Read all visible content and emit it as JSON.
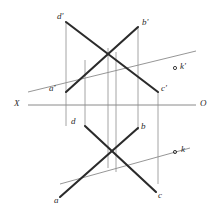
{
  "figure": {
    "type": "descriptive-geometry-projection-diagram",
    "background_color": "#ffffff",
    "ink_color": "#2b2b2b",
    "thin_line_color": "#8a8a8a",
    "connector_line_color": "#9a9a9a",
    "axis_label_left": "X",
    "axis_label_right": "O",
    "axis": {
      "name": "x-axis-ground-line",
      "x1": 28,
      "y1": 105,
      "x2": 196,
      "y2": 105
    },
    "points": {
      "a_prime": {
        "label": "a'",
        "x": 66,
        "y": 92,
        "label_x": 49,
        "label_y": 84
      },
      "b_prime": {
        "label": "b'",
        "x": 138,
        "y": 27,
        "label_x": 142,
        "label_y": 18
      },
      "c_prime": {
        "label": "c'",
        "x": 158,
        "y": 92,
        "label_x": 161,
        "label_y": 84
      },
      "d_prime": {
        "label": "d'",
        "x": 66,
        "y": 22,
        "label_x": 57,
        "label_y": 12
      },
      "a": {
        "label": "a",
        "x": 60,
        "y": 197,
        "label_x": 54,
        "label_y": 196
      },
      "b": {
        "label": "b",
        "x": 138,
        "y": 128,
        "label_x": 141,
        "label_y": 122
      },
      "c": {
        "label": "c",
        "x": 156,
        "y": 192,
        "label_x": 158,
        "label_y": 191
      },
      "d": {
        "label": "d",
        "x": 85,
        "y": 126,
        "label_x": 71,
        "label_y": 117
      },
      "k_prime": {
        "label": "k'",
        "x": 175,
        "y": 68,
        "label_x": 180,
        "label_y": 62
      },
      "k": {
        "label": "k",
        "x": 175,
        "y": 152,
        "label_x": 181,
        "label_y": 145
      }
    },
    "thick_segments": [
      {
        "name": "segment-d-prime-c-prime",
        "x1": 66,
        "y1": 22,
        "x2": 158,
        "y2": 92
      },
      {
        "name": "segment-a-prime-b-prime",
        "x1": 66,
        "y1": 92,
        "x2": 138,
        "y2": 27
      },
      {
        "name": "segment-d-b",
        "x1": 85,
        "y1": 126,
        "x2": 156,
        "y2": 192
      },
      {
        "name": "segment-a-b",
        "x1": 60,
        "y1": 197,
        "x2": 138,
        "y2": 128
      }
    ],
    "thin_lines": [
      {
        "name": "line-through-k-prime",
        "x1": 28,
        "y1": 92,
        "x2": 196,
        "y2": 51
      },
      {
        "name": "line-through-k",
        "x1": 60,
        "y1": 184,
        "x2": 190,
        "y2": 148
      }
    ],
    "connector_lines": [
      {
        "name": "connector-1",
        "x": 66,
        "y1": 22,
        "y2": 126
      },
      {
        "name": "connector-2",
        "x": 85,
        "y1": 60,
        "y2": 126
      },
      {
        "name": "connector-3",
        "x": 108,
        "y1": 48,
        "y2": 168
      },
      {
        "name": "connector-4",
        "x": 116,
        "y1": 52,
        "y2": 172
      },
      {
        "name": "connector-5",
        "x": 138,
        "y1": 27,
        "y2": 130
      },
      {
        "name": "connector-6",
        "x": 158,
        "y1": 92,
        "y2": 184
      }
    ],
    "axis_label_positions": {
      "x_label_x": 14,
      "x_label_y": 99,
      "o_label_x": 200,
      "o_label_y": 99
    }
  }
}
